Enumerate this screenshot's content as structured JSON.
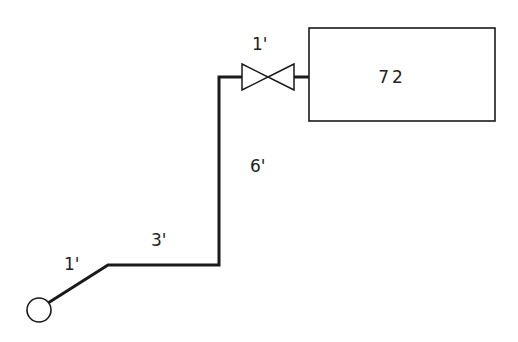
{
  "diagram": {
    "type": "piping-schematic",
    "tank": {
      "label": "72"
    },
    "valve": {
      "length_label": "1'"
    },
    "segments": [
      {
        "name": "vertical-riser",
        "length_label": "6'"
      },
      {
        "name": "horizontal-run",
        "length_label": "3'"
      },
      {
        "name": "diagonal-run",
        "length_label": "1'"
      }
    ],
    "colors": {
      "stroke": "#1a1a1a",
      "background": "#ffffff"
    }
  }
}
